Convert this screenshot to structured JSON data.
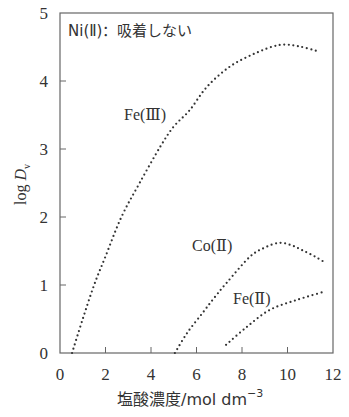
{
  "chart_data": {
    "type": "line",
    "title": "",
    "xlabel": "塩酸濃度/mol dm⁻³",
    "xlabel_main": "塩酸濃度/mol dm",
    "xlabel_sup": "−3",
    "ylabel": "log D_v",
    "ylabel_main": "log ",
    "ylabel_var": "D",
    "ylabel_sub": "v",
    "xlim": [
      0,
      12
    ],
    "ylim": [
      0,
      5
    ],
    "xticks": [
      0,
      2,
      4,
      6,
      8,
      10,
      12
    ],
    "yticks": [
      0,
      1,
      2,
      3,
      4,
      5
    ],
    "grid": false,
    "legend": "none (inline labels)",
    "line_style": "dotted",
    "annotation": "Ni(Ⅱ)：吸着しない",
    "series": [
      {
        "name": "Fe(Ⅲ)",
        "label": "Fe(Ⅲ)",
        "x": [
          0.53,
          1.0,
          1.5,
          2.0,
          2.7,
          3.5,
          4.4,
          5.0,
          5.7,
          6.45,
          7.46,
          8.6,
          9.65,
          10.5,
          11.4
        ],
        "y": [
          0.0,
          0.5,
          1.0,
          1.42,
          2.0,
          2.5,
          3.03,
          3.33,
          3.57,
          3.91,
          4.21,
          4.41,
          4.53,
          4.51,
          4.43
        ]
      },
      {
        "name": "Co(Ⅱ)",
        "label": "Co(Ⅱ)",
        "x": [
          5.05,
          5.6,
          6.27,
          6.8,
          7.32,
          8.33,
          9.0,
          9.65,
          10.2,
          10.66,
          11.2,
          11.7
        ],
        "y": [
          0.0,
          0.3,
          0.59,
          0.82,
          1.03,
          1.41,
          1.55,
          1.62,
          1.58,
          1.51,
          1.42,
          1.32
        ]
      },
      {
        "name": "Fe(Ⅱ)",
        "label": "Fe(Ⅱ)",
        "x": [
          7.3,
          8.2,
          9.2,
          10.4,
          11.6
        ],
        "y": [
          0.12,
          0.38,
          0.63,
          0.78,
          0.9
        ]
      }
    ]
  },
  "colors": {
    "axis": "#555555",
    "dots": "#333333",
    "text": "#333333"
  }
}
